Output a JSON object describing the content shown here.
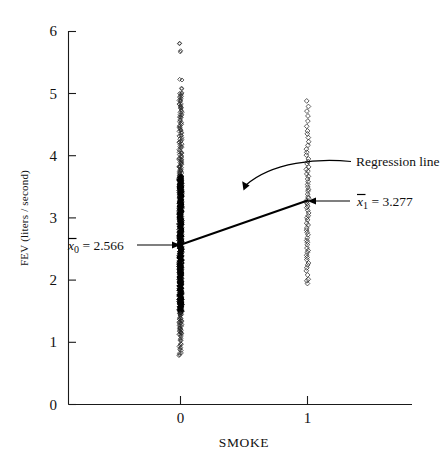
{
  "figure": {
    "title": "",
    "y_axis_label": "FEV (liters / second)",
    "x_axis_label": "SMOKE",
    "y_ticks": [
      "0",
      "1",
      "2",
      "3",
      "4",
      "5",
      "6"
    ],
    "x_ticks": [
      "0",
      "1"
    ]
  },
  "annotations": {
    "mean0": {
      "symbol": "x",
      "subscript": "0",
      "equals": "=",
      "value": "2.566",
      "full": "x̅0 = 2.566"
    },
    "mean1": {
      "symbol": "x",
      "subscript": "1",
      "equals": "=",
      "value": "3.277",
      "full": "x̅1 = 3.277"
    },
    "regression": {
      "label": "Regression line"
    }
  },
  "chart_data": {
    "type": "scatter",
    "title": "",
    "xlabel": "SMOKE",
    "ylabel": "FEV (liters / second)",
    "xlim": [
      -0.38,
      1.62
    ],
    "ylim": [
      0,
      6
    ],
    "xticks": [
      0,
      1
    ],
    "yticks": [
      0,
      1,
      2,
      3,
      4,
      5,
      6
    ],
    "grid": false,
    "legend": null,
    "marker": "open-diamond",
    "series": [
      {
        "name": "SMOKE = 0",
        "x": 0,
        "mean": 2.566,
        "y_min": 0.79,
        "y_max": 5.79,
        "count": 589,
        "values": [
          5.79,
          5.67,
          5.22,
          5.08,
          5.01,
          4.99,
          4.96,
          4.93,
          4.9,
          4.87,
          4.84,
          4.81,
          4.78,
          4.75,
          4.72,
          4.69,
          4.66,
          4.63,
          4.6,
          4.57,
          4.54,
          4.51,
          4.48,
          4.45,
          4.42,
          4.39,
          4.36,
          4.33,
          4.3,
          4.27,
          4.24,
          4.21,
          4.18,
          4.15,
          4.12,
          4.09,
          4.06,
          4.03,
          4.0,
          3.98,
          3.96,
          3.94,
          3.92,
          3.9,
          3.88,
          3.86,
          3.84,
          3.82,
          3.8,
          3.78,
          3.76,
          3.74,
          3.72,
          3.7,
          3.68,
          3.66,
          3.64,
          3.62,
          3.6,
          3.58,
          3.56,
          3.54,
          3.52,
          3.5,
          3.48,
          3.46,
          3.44,
          3.42,
          3.4,
          3.38,
          3.36,
          3.34,
          3.32,
          3.3,
          3.28,
          3.26,
          3.24,
          3.22,
          3.2,
          3.18,
          3.16,
          3.14,
          3.12,
          3.1,
          3.08,
          3.06,
          3.04,
          3.02,
          3.0,
          2.98,
          2.96,
          2.94,
          2.92,
          2.9,
          2.88,
          2.86,
          2.84,
          2.82,
          2.8,
          2.78,
          2.76,
          2.74,
          2.72,
          2.7,
          2.68,
          2.66,
          2.64,
          2.62,
          2.6,
          2.58,
          2.56,
          2.54,
          2.52,
          2.5,
          2.48,
          2.46,
          2.44,
          2.42,
          2.4,
          2.38,
          2.36,
          2.34,
          2.32,
          2.3,
          2.28,
          2.26,
          2.24,
          2.22,
          2.2,
          2.18,
          2.16,
          2.14,
          2.12,
          2.1,
          2.08,
          2.06,
          2.04,
          2.02,
          2.0,
          1.98,
          1.96,
          1.94,
          1.92,
          1.9,
          1.88,
          1.86,
          1.84,
          1.82,
          1.8,
          1.78,
          1.76,
          1.74,
          1.72,
          1.7,
          1.68,
          1.66,
          1.64,
          1.62,
          1.6,
          1.58,
          1.56,
          1.54,
          1.52,
          1.5,
          1.48,
          1.46,
          1.44,
          1.42,
          1.4,
          1.38,
          1.36,
          1.34,
          1.32,
          1.3,
          1.28,
          1.26,
          1.24,
          1.22,
          1.2,
          1.18,
          1.16,
          1.14,
          1.12,
          1.1,
          1.06,
          1.02,
          0.98,
          0.94,
          0.91,
          0.87,
          0.83,
          0.79
        ]
      },
      {
        "name": "SMOKE = 1",
        "x": 1,
        "mean": 3.277,
        "y_min": 1.95,
        "y_max": 4.87,
        "count": 65,
        "values": [
          4.87,
          4.79,
          4.71,
          4.64,
          4.55,
          4.47,
          4.4,
          4.34,
          4.28,
          4.22,
          4.16,
          4.1,
          4.05,
          4.0,
          3.95,
          3.9,
          3.86,
          3.82,
          3.78,
          3.74,
          3.7,
          3.66,
          3.62,
          3.58,
          3.54,
          3.5,
          3.46,
          3.42,
          3.38,
          3.34,
          3.31,
          3.28,
          3.25,
          3.22,
          3.19,
          3.16,
          3.12,
          3.08,
          3.04,
          3.0,
          2.96,
          2.92,
          2.88,
          2.84,
          2.8,
          2.76,
          2.72,
          2.68,
          2.64,
          2.6,
          2.56,
          2.52,
          2.48,
          2.44,
          2.4,
          2.36,
          2.32,
          2.28,
          2.24,
          2.2,
          2.14,
          2.08,
          2.02,
          1.98,
          1.95
        ]
      }
    ],
    "regression_line": {
      "label": "Regression line",
      "points": [
        {
          "x": 0,
          "y": 2.566
        },
        {
          "x": 1,
          "y": 3.277
        }
      ],
      "intercept": 2.566,
      "slope": 0.711
    }
  }
}
